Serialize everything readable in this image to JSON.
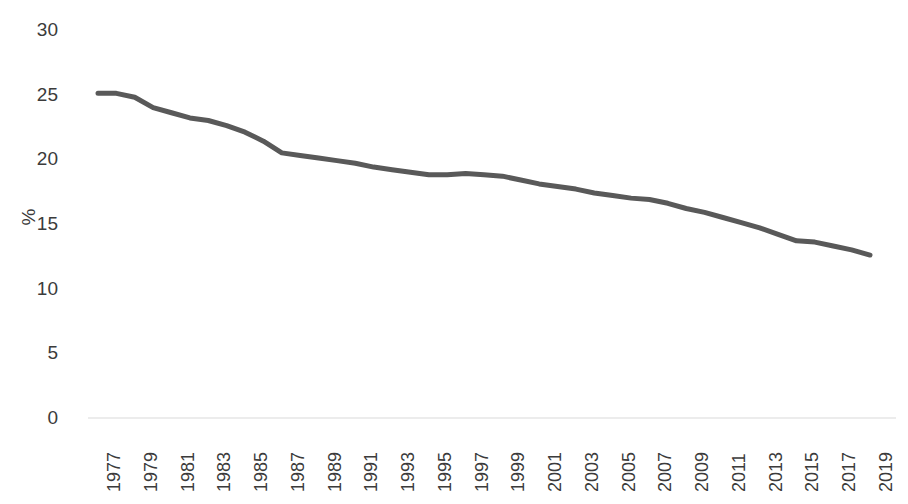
{
  "chart_data": {
    "type": "line",
    "title": "",
    "subtitle": "",
    "xlabel": "",
    "ylabel": "%",
    "ylim": [
      0,
      30
    ],
    "ytick_labels": [
      "0",
      "5",
      "10",
      "15",
      "20",
      "25",
      "30"
    ],
    "ytick_values": [
      0,
      5,
      10,
      15,
      20,
      25,
      30
    ],
    "grid": false,
    "legend": null,
    "legend_position": "none",
    "x": [
      1977,
      1978,
      1979,
      1980,
      1981,
      1982,
      1983,
      1984,
      1985,
      1986,
      1987,
      1988,
      1989,
      1990,
      1991,
      1992,
      1993,
      1994,
      1995,
      1996,
      1997,
      1998,
      1999,
      2000,
      2001,
      2002,
      2003,
      2004,
      2005,
      2006,
      2007,
      2008,
      2009,
      2010,
      2011,
      2012,
      2013,
      2014,
      2015,
      2016,
      2017,
      2018,
      2019
    ],
    "xtick_labels": [
      "1977",
      "1979",
      "1981",
      "1983",
      "1985",
      "1987",
      "1989",
      "1991",
      "1993",
      "1995",
      "1997",
      "1999",
      "2001",
      "2003",
      "2005",
      "2007",
      "2009",
      "2011",
      "2013",
      "2015",
      "2017",
      "2019"
    ],
    "xtick_values": [
      1977,
      1979,
      1981,
      1983,
      1985,
      1987,
      1989,
      1991,
      1993,
      1995,
      1997,
      1999,
      2001,
      2003,
      2005,
      2007,
      2009,
      2011,
      2013,
      2015,
      2017,
      2019
    ],
    "xlim": [
      1977,
      2019
    ],
    "series": [
      {
        "name": "value",
        "color": "#595959",
        "line_width": 5,
        "values": [
          25.1,
          25.1,
          24.8,
          24.0,
          23.6,
          23.2,
          23.0,
          22.6,
          22.1,
          21.4,
          20.5,
          20.3,
          20.1,
          19.9,
          19.7,
          19.4,
          19.2,
          19.0,
          18.8,
          18.8,
          18.9,
          18.8,
          18.7,
          18.4,
          18.1,
          17.9,
          17.7,
          17.4,
          17.2,
          17.0,
          16.9,
          16.6,
          16.2,
          15.9,
          15.5,
          15.1,
          14.7,
          14.2,
          13.7,
          13.6,
          13.3,
          13.0,
          12.6
        ]
      }
    ]
  },
  "axes": {
    "y_axis_title": "%",
    "baseline_color": "#d9d9d9",
    "text_color": "#3b3b3b"
  }
}
